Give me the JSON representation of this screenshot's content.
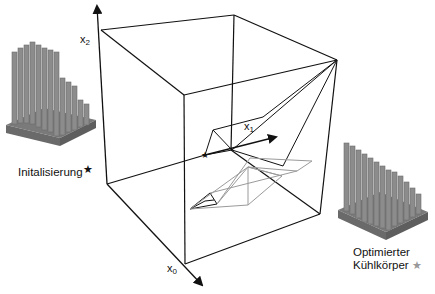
{
  "axes": {
    "x0": {
      "name": "x",
      "sub": "0"
    },
    "x1": {
      "name": "x",
      "sub": "1"
    },
    "x2": {
      "name": "x",
      "sub": "2"
    }
  },
  "labels": {
    "initial": {
      "text": "Initalisierung",
      "marker": "★",
      "marker_color": "#111111"
    },
    "optimized": {
      "line1": "Optimierter",
      "line2": "Kühlkörper",
      "marker": "★",
      "marker_color": "#999999"
    }
  },
  "colors": {
    "line": "#111111",
    "path_gray": "#9a9a9a",
    "heatsink_fill": "#8a8a8a",
    "heatsink_dark": "#6e6e6e",
    "heatsink_light": "#a8a8a8"
  },
  "cube_vertices": {
    "origin": [
      107,
      184
    ],
    "x2_top": [
      101,
      30
    ],
    "back_top": [
      234,
      15
    ],
    "right_top": [
      337,
      60
    ],
    "front_top": [
      184,
      95
    ],
    "front_bottom": [
      185,
      264
    ],
    "right_bottom": [
      320,
      214
    ],
    "inner_bottom": [
      231,
      150
    ]
  }
}
